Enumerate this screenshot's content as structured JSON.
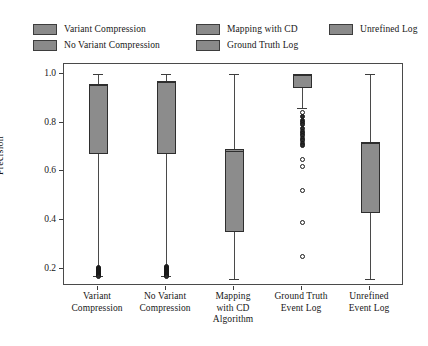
{
  "legend": {
    "entries": [
      {
        "label": "Variant Compression",
        "color": "#8a8a8a",
        "col": 0,
        "row": 0
      },
      {
        "label": "No Variant Compression",
        "color": "#8a8a8a",
        "col": 0,
        "row": 1
      },
      {
        "label": "Mapping with CD",
        "color": "#8a8a8a",
        "col": 1,
        "row": 0
      },
      {
        "label": "Ground Truth Log",
        "color": "#8a8a8a",
        "col": 1,
        "row": 1
      },
      {
        "label": "Unrefined Log",
        "color": "#8a8a8a",
        "col": 2,
        "row": 0
      }
    ]
  },
  "axes": {
    "ylabel": "Precision",
    "yticks": [
      "0.2",
      "0.4",
      "0.6",
      "0.8",
      "1.0"
    ],
    "ytick_values": [
      0.2,
      0.4,
      0.6,
      0.8,
      1.0
    ],
    "ylim": [
      0.13,
      1.04
    ],
    "xtick_labels": [
      "Variant\nCompression",
      "No Variant\nCompression",
      "Mapping\nwith CD\nAlgorithm",
      "Ground Truth\nEvent Log",
      "Unrefined\nEvent Log"
    ]
  },
  "chart_data": {
    "type": "box",
    "title": "",
    "xlabel": "",
    "ylabel": "Precision",
    "ylim": [
      0.13,
      1.04
    ],
    "grid": false,
    "legend_position": "top",
    "box_fill_color": "#8c8c8c",
    "categories": [
      "Variant Compression",
      "No Variant Compression",
      "Mapping with CD Algorithm",
      "Ground Truth Event Log",
      "Unrefined Event Log"
    ],
    "boxes": [
      {
        "name": "Variant Compression",
        "whisker_low": 0.17,
        "q1": 0.67,
        "median": 0.955,
        "q3": 0.96,
        "whisker_high": 1.0,
        "outliers": [
          0.205,
          0.201,
          0.197,
          0.193,
          0.189,
          0.186,
          0.182,
          0.179,
          0.176,
          0.173,
          0.171,
          0.168
        ]
      },
      {
        "name": "No Variant Compression",
        "whisker_low": 0.17,
        "q1": 0.67,
        "median": 0.965,
        "q3": 0.97,
        "whisker_high": 1.0,
        "outliers": [
          0.208,
          0.204,
          0.2,
          0.196,
          0.192,
          0.188,
          0.185,
          0.181,
          0.178,
          0.175,
          0.172,
          0.169
        ]
      },
      {
        "name": "Mapping with CD Algorithm",
        "whisker_low": 0.16,
        "q1": 0.35,
        "median": 0.685,
        "q3": 0.69,
        "whisker_high": 1.0,
        "outliers": []
      },
      {
        "name": "Ground Truth Event Log",
        "whisker_low": 0.86,
        "q1": 0.94,
        "median": 0.995,
        "q3": 1.0,
        "whisker_high": 1.0,
        "outliers": [
          0.84,
          0.825,
          0.81,
          0.8,
          0.79,
          0.775,
          0.765,
          0.755,
          0.745,
          0.735,
          0.725,
          0.715,
          0.705,
          0.65,
          0.62,
          0.52,
          0.39,
          0.25
        ]
      },
      {
        "name": "Unrefined Event Log",
        "whisker_low": 0.16,
        "q1": 0.43,
        "median": 0.715,
        "q3": 0.72,
        "whisker_high": 1.0,
        "outliers": []
      }
    ]
  }
}
